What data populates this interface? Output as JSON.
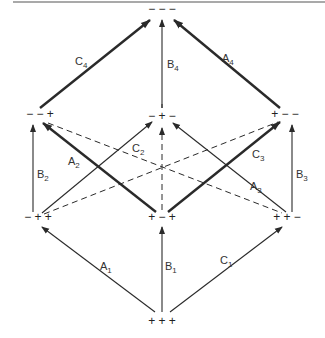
{
  "diagram": {
    "type": "sign-configuration lattice (cube projection)",
    "nodes": [
      {
        "id": "top",
        "label": "− − −",
        "x": 162,
        "y": 13
      },
      {
        "id": "ul",
        "label": "− − +",
        "x": 40,
        "y": 118
      },
      {
        "id": "uc",
        "label": "− + −",
        "x": 162,
        "y": 120
      },
      {
        "id": "ur",
        "label": "+ − −",
        "x": 285,
        "y": 118
      },
      {
        "id": "ll",
        "label": "− + +",
        "x": 38,
        "y": 221
      },
      {
        "id": "lc",
        "label": "+ − +",
        "x": 162,
        "y": 221
      },
      {
        "id": "lr",
        "label": "+ + −",
        "x": 287,
        "y": 221
      },
      {
        "id": "bot",
        "label": "+ + +",
        "x": 162,
        "y": 325
      }
    ],
    "edges": [
      {
        "name": "C",
        "sub": "4",
        "from": [
          40,
          108
        ],
        "to": [
          150,
          20
        ],
        "style": "thick",
        "lx": 75,
        "ly": 65
      },
      {
        "name": "B",
        "sub": "4",
        "from": [
          162,
          108
        ],
        "to": [
          162,
          20
        ],
        "style": "thin",
        "lx": 167,
        "ly": 68
      },
      {
        "name": "A",
        "sub": "4",
        "from": [
          280,
          108
        ],
        "to": [
          174,
          20
        ],
        "style": "thick",
        "lx": 222,
        "ly": 62
      },
      {
        "name": "B",
        "sub": "2",
        "from": [
          33,
          212
        ],
        "to": [
          33,
          125
        ],
        "style": "thin",
        "lx": 37,
        "ly": 178
      },
      {
        "name": "A",
        "sub": "2",
        "from": [
          156,
          212
        ],
        "to": [
          43,
          123
        ],
        "style": "thick",
        "lx": 68,
        "ly": 165
      },
      {
        "name": "C",
        "sub": "2",
        "from": [
          42,
          213
        ],
        "to": [
          152,
          122
        ],
        "style": "thin",
        "lx": 132,
        "ly": 152
      },
      {
        "name": "C",
        "sub": "3",
        "from": [
          168,
          212
        ],
        "to": [
          280,
          122
        ],
        "style": "thick",
        "lx": 252,
        "ly": 158
      },
      {
        "name": "A",
        "sub": "3",
        "from": [
          286,
          212
        ],
        "to": [
          173,
          123
        ],
        "style": "thin",
        "lx": 250,
        "ly": 190
      },
      {
        "name": "B",
        "sub": "3",
        "from": [
          292,
          212
        ],
        "to": [
          292,
          125
        ],
        "style": "thin",
        "lx": 296,
        "ly": 178
      },
      {
        "name": "A",
        "sub": "1",
        "from": [
          155,
          312
        ],
        "to": [
          42,
          227
        ],
        "style": "thin",
        "lx": 100,
        "ly": 270
      },
      {
        "name": "B",
        "sub": "1",
        "from": [
          162,
          312
        ],
        "to": [
          162,
          227
        ],
        "style": "thin",
        "lx": 165,
        "ly": 270
      },
      {
        "name": "C",
        "sub": "1",
        "from": [
          170,
          312
        ],
        "to": [
          282,
          227
        ],
        "style": "thin",
        "lx": 220,
        "ly": 264
      }
    ],
    "dashed": [
      {
        "from": [
          48,
          123
        ],
        "to": [
          282,
          213
        ],
        "arrow": false
      },
      {
        "from": [
          44,
          214
        ],
        "to": [
          278,
          122
        ],
        "arrow": false
      },
      {
        "from": [
          162,
          210
        ],
        "to": [
          162,
          128
        ],
        "arrow": true
      },
      {
        "from": [
          162,
          108
        ],
        "to": [
          162,
          104
        ],
        "arrow": false
      }
    ],
    "colors": {
      "ink": "#2a2a2a",
      "background": "#ffffff",
      "rule": "#555555"
    }
  }
}
